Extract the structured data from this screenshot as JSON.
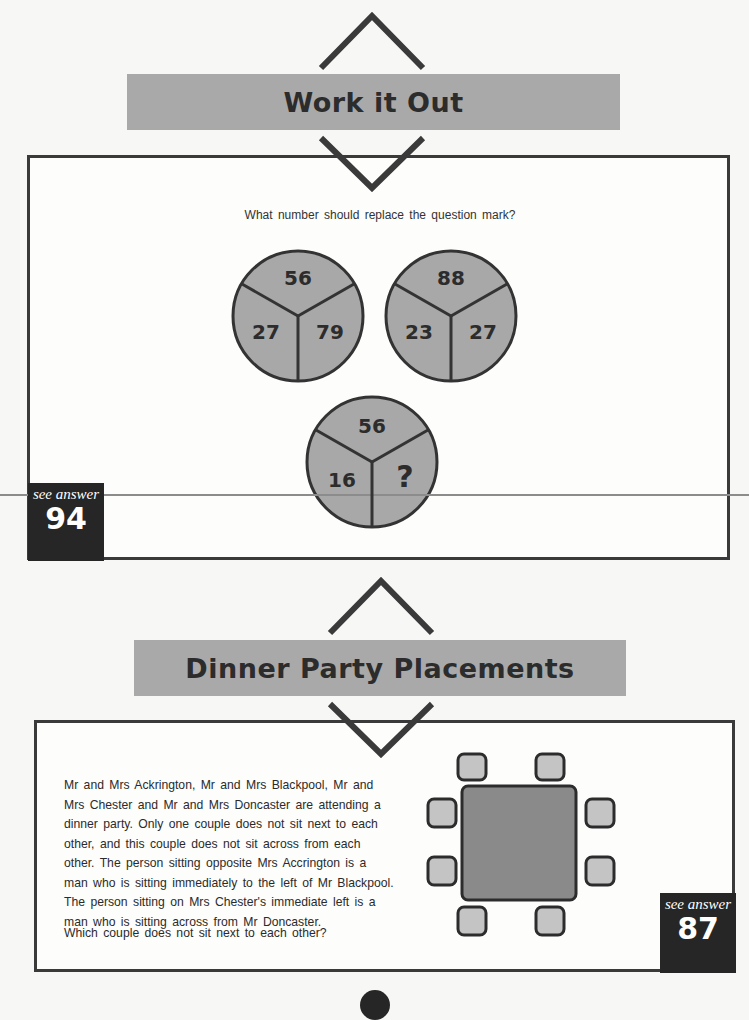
{
  "puzzle1": {
    "title": "Work it Out",
    "question": "What number should replace the question mark?",
    "circles": [
      {
        "top": "56",
        "left": "27",
        "right": "79"
      },
      {
        "top": "88",
        "left": "23",
        "right": "27"
      },
      {
        "top": "56",
        "left": "16",
        "right": "?"
      }
    ],
    "answer_label": "see answer",
    "answer_number": "94"
  },
  "puzzle2": {
    "title": "Dinner Party Placements",
    "paragraph": "Mr and Mrs Ackrington, Mr and Mrs Blackpool, Mr and Mrs Chester and Mr and Mrs Doncaster are attending a dinner party. Only one couple does not sit next to each other, and this couple does not sit across from each other. The person sitting opposite Mrs Accrington is a man who is sitting immediately to the left of Mr Blackpool. The person sitting on Mrs Chester's immediate left is a man who is sitting across from Mr Doncaster.",
    "question": "Which couple does not sit next to each other?",
    "diagram": {
      "table": "square-table",
      "seats": 8
    },
    "answer_label": "see answer",
    "answer_number": "87"
  },
  "colors": {
    "banner": "#a9a9a9",
    "circle_fill": "#a8a8a8",
    "table_fill": "#8a8a8a",
    "seat_fill": "#c4c4c4",
    "dark": "#262626"
  }
}
